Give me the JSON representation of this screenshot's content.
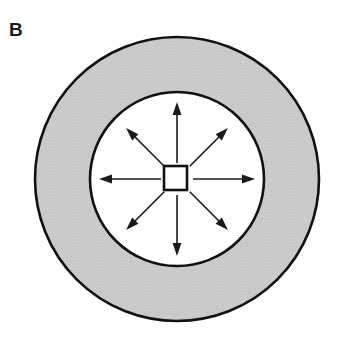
{
  "figure": {
    "panel_label": "B",
    "type": "schematic-diagram",
    "background_color": "#ffffff",
    "stroke_color": "#000000"
  },
  "shapes": {
    "outer_circle": {
      "name": "outer-ring-circle",
      "cx": 177,
      "cy": 179,
      "r": 142,
      "fill_color": "#c9c9c9",
      "stroke_color": "#111111",
      "stroke_width": 2.6
    },
    "inner_circle": {
      "name": "inner-disc-circle",
      "cx": 177,
      "cy": 179,
      "r": 87,
      "fill_color": "#ffffff",
      "stroke_color": "#111111",
      "stroke_width": 2.6
    },
    "center_square": {
      "name": "center-square",
      "x": 164,
      "y": 166,
      "width": 23,
      "height": 24,
      "fill_color": "#ffffff",
      "stroke_color": "#111111",
      "stroke_width": 2.6
    }
  },
  "arrows": {
    "stroke_color": "#1a1a1a",
    "stroke_width": 1.6,
    "count": 8,
    "items": [
      {
        "id": "arrow-north",
        "direction": "N",
        "angle_deg": 270,
        "start_radius": 16,
        "end_radius": 77
      },
      {
        "id": "arrow-northeast",
        "direction": "NE",
        "angle_deg": 315,
        "start_radius": 18,
        "end_radius": 72
      },
      {
        "id": "arrow-east",
        "direction": "E",
        "angle_deg": 0,
        "start_radius": 16,
        "end_radius": 78
      },
      {
        "id": "arrow-southeast",
        "direction": "SE",
        "angle_deg": 45,
        "start_radius": 18,
        "end_radius": 72
      },
      {
        "id": "arrow-south",
        "direction": "S",
        "angle_deg": 90,
        "start_radius": 16,
        "end_radius": 77
      },
      {
        "id": "arrow-southwest",
        "direction": "SW",
        "angle_deg": 135,
        "start_radius": 18,
        "end_radius": 72
      },
      {
        "id": "arrow-west",
        "direction": "W",
        "angle_deg": 180,
        "start_radius": 16,
        "end_radius": 78
      },
      {
        "id": "arrow-northwest",
        "direction": "NW",
        "angle_deg": 225,
        "start_radius": 18,
        "end_radius": 72
      }
    ]
  }
}
